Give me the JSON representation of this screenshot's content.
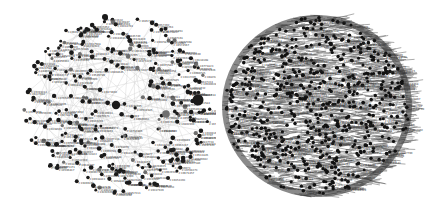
{
  "figure": {
    "panels": [
      {
        "id": "left",
        "description": "sparse network graph with labeled nodes",
        "center": [
          117,
          105
        ],
        "radius": [
          96,
          92
        ],
        "node_count": 320,
        "edge_count": 140,
        "label_prefix": "2:",
        "node_color": "#1a1a1a",
        "secondary_node_color": "#6e6e6e",
        "edge_color": "#c8c8c8",
        "label_color": "#333333",
        "hubs": [
          {
            "x": 198,
            "y": 100,
            "r": 5.5,
            "color": "#1a1a1a"
          },
          {
            "x": 116,
            "y": 105,
            "r": 4.2,
            "color": "#1a1a1a"
          },
          {
            "x": 166,
            "y": 114,
            "r": 3.8,
            "color": "#707070"
          },
          {
            "x": 105,
            "y": 17,
            "r": 3.0,
            "color": "#1a1a1a"
          }
        ],
        "seed": 7
      },
      {
        "id": "right",
        "description": "dense spherical network graph",
        "center": [
          101,
          106
        ],
        "radius": [
          95,
          91
        ],
        "node_count": 620,
        "edge_count": 2600,
        "label_prefix": "2:",
        "node_color": "#111111",
        "edge_color": "#555555",
        "label_color": "#444444",
        "seed": 13
      }
    ]
  }
}
